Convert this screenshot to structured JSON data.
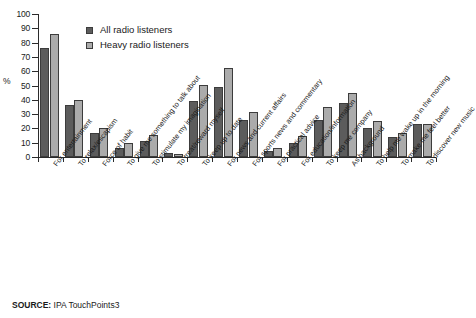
{
  "chart_data": {
    "type": "bar",
    "title": "",
    "xlabel": "",
    "ylabel": "%",
    "ylim": [
      0,
      100
    ],
    "yticks": [
      0,
      10,
      20,
      30,
      40,
      50,
      60,
      70,
      80,
      90,
      100
    ],
    "grid": false,
    "legend_position": "top-left-inside",
    "categories": [
      "For entertainment",
      "To relax/escapism",
      "Force of habit",
      "To give me something to talk about",
      "To stimulate my imagination",
      "To treat/reward myself",
      "To keep up to date",
      "For news and current affairs",
      "For sports news and commentary",
      "For practical advice",
      "For education/information",
      "To keep me company",
      "As background",
      "To help me wake up in the morning",
      "To make me feel better",
      "To discover new music"
    ],
    "series": [
      {
        "name": "All radio listeners",
        "color": "#5c5c5c",
        "values": [
          76,
          36.5,
          16.5,
          6.5,
          11,
          3,
          39,
          49,
          26,
          4,
          10,
          26,
          38,
          20.5,
          14,
          23
        ]
      },
      {
        "name": "Heavy radio listeners",
        "color": "#ababab",
        "values": [
          86,
          40,
          20.5,
          10,
          15.5,
          2,
          50.5,
          62,
          31.5,
          6.5,
          15,
          35,
          45,
          25.5,
          16.5,
          23
        ]
      }
    ]
  },
  "source": {
    "label": "SOURCE:",
    "text": "IPA TouchPoints3"
  }
}
